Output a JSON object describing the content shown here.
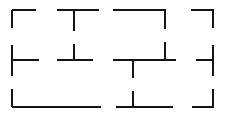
{
  "figure": {
    "canvas": {
      "width": 226,
      "height": 118,
      "background_color": "#ffffff"
    },
    "style": {
      "stroke_color": "#151515",
      "stroke_width": 2.6
    },
    "guides": {
      "row_y": [
        10,
        60,
        107
      ],
      "col_x": [
        12,
        74,
        133,
        165,
        213
      ]
    },
    "segments": [
      {
        "name": "top-row-seg-left",
        "orientation": "horizontal",
        "x1": 12,
        "y1": 10,
        "x2": 36,
        "y2": 10
      },
      {
        "name": "top-row-seg-second",
        "orientation": "horizontal",
        "x1": 57,
        "y1": 10,
        "x2": 99,
        "y2": 10
      },
      {
        "name": "top-row-seg-third",
        "orientation": "horizontal",
        "x1": 113,
        "y1": 10,
        "x2": 166,
        "y2": 10
      },
      {
        "name": "top-row-seg-right",
        "orientation": "horizontal",
        "x1": 191,
        "y1": 10,
        "x2": 214,
        "y2": 10
      },
      {
        "name": "middle-row-stub-left",
        "orientation": "horizontal",
        "x1": 12,
        "y1": 60,
        "x2": 39,
        "y2": 60
      },
      {
        "name": "middle-row-seg-second",
        "orientation": "horizontal",
        "x1": 57,
        "y1": 60,
        "x2": 93,
        "y2": 60
      },
      {
        "name": "middle-row-seg-third",
        "orientation": "horizontal",
        "x1": 113,
        "y1": 60,
        "x2": 176,
        "y2": 60
      },
      {
        "name": "middle-row-stub-right",
        "orientation": "horizontal",
        "x1": 196,
        "y1": 60,
        "x2": 214,
        "y2": 60
      },
      {
        "name": "bottom-row-seg-left",
        "orientation": "horizontal",
        "x1": 12,
        "y1": 107,
        "x2": 101,
        "y2": 107
      },
      {
        "name": "bottom-row-seg-middle",
        "orientation": "horizontal",
        "x1": 116,
        "y1": 107,
        "x2": 173,
        "y2": 107
      },
      {
        "name": "bottom-row-seg-right",
        "orientation": "horizontal",
        "x1": 192,
        "y1": 107,
        "x2": 214,
        "y2": 107
      },
      {
        "name": "left-col-seg-top",
        "orientation": "vertical",
        "x1": 12,
        "y1": 10,
        "x2": 12,
        "y2": 28
      },
      {
        "name": "left-col-seg-middle",
        "orientation": "vertical",
        "x1": 12,
        "y1": 45,
        "x2": 12,
        "y2": 76
      },
      {
        "name": "left-col-seg-bottom",
        "orientation": "vertical",
        "x1": 12,
        "y1": 89,
        "x2": 12,
        "y2": 107
      },
      {
        "name": "second-col-stub-top",
        "orientation": "vertical",
        "x1": 74,
        "y1": 10,
        "x2": 74,
        "y2": 31
      },
      {
        "name": "second-col-stub-middle",
        "orientation": "vertical",
        "x1": 74,
        "y1": 44,
        "x2": 74,
        "y2": 60
      },
      {
        "name": "third-col-stub-middle",
        "orientation": "vertical",
        "x1": 133,
        "y1": 60,
        "x2": 133,
        "y2": 78
      },
      {
        "name": "third-col-stub-bottom",
        "orientation": "vertical",
        "x1": 133,
        "y1": 91,
        "x2": 133,
        "y2": 107
      },
      {
        "name": "fourth-col-stub-top",
        "orientation": "vertical",
        "x1": 165,
        "y1": 10,
        "x2": 165,
        "y2": 29
      },
      {
        "name": "fourth-col-stub-middle",
        "orientation": "vertical",
        "x1": 165,
        "y1": 42,
        "x2": 165,
        "y2": 60
      },
      {
        "name": "right-col-seg-top",
        "orientation": "vertical",
        "x1": 213,
        "y1": 10,
        "x2": 213,
        "y2": 28
      },
      {
        "name": "right-col-seg-middle",
        "orientation": "vertical",
        "x1": 213,
        "y1": 45,
        "x2": 213,
        "y2": 76
      },
      {
        "name": "right-col-seg-bottom",
        "orientation": "vertical",
        "x1": 213,
        "y1": 89,
        "x2": 213,
        "y2": 107
      }
    ]
  }
}
